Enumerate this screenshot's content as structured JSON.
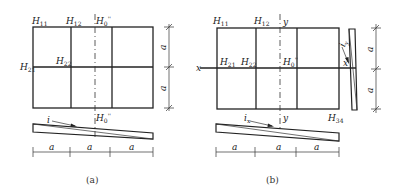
{
  "figure_a": {
    "caption": "(a)",
    "labels": {
      "h11": {
        "base": "H",
        "sub": "11"
      },
      "h12": {
        "base": "H",
        "sub": "12"
      },
      "h0_top": {
        "base": "H",
        "sub": "0",
        "sup": "''"
      },
      "h21": {
        "base": "H",
        "sub": "21"
      },
      "h22": {
        "base": "H",
        "sub": "22"
      },
      "h0_bottom": {
        "base": "H",
        "sub": "0",
        "sup": "''"
      },
      "slope": "i"
    },
    "vertical_dims": [
      "a",
      "a"
    ],
    "horizontal_dims": [
      "a",
      "a",
      "a"
    ]
  },
  "figure_b": {
    "caption": "(b)",
    "labels": {
      "h11": {
        "base": "H",
        "sub": "11"
      },
      "h12": {
        "base": "H",
        "sub": "12"
      },
      "y_top": "y",
      "h21": {
        "base": "H",
        "sub": "21"
      },
      "h22": {
        "base": "H",
        "sub": "22"
      },
      "h0": {
        "base": "H",
        "sub": "0",
        "sup": "''"
      },
      "x_left": "x",
      "x_right": "x",
      "y_bottom": "y",
      "h34": {
        "base": "H",
        "sub": "34"
      },
      "slope_x": {
        "base": "i",
        "sub": "x"
      },
      "slope_y": {
        "base": "i",
        "sub": "y"
      }
    },
    "vertical_dims": [
      "a",
      "a"
    ],
    "horizontal_dims": [
      "a",
      "a",
      "a"
    ]
  }
}
